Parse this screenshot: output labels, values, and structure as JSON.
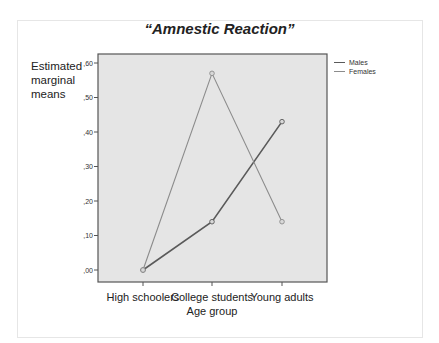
{
  "chart_data": {
    "type": "line",
    "title": "“Amnestic Reaction”",
    "xlabel": "Age group",
    "ylabel": "Estimated marginal means",
    "categories": [
      "High schoolers",
      "College students",
      "Young adults"
    ],
    "series": [
      {
        "name": "Males",
        "values": [
          0.0,
          0.14,
          0.43
        ],
        "color": "#5a5a5a"
      },
      {
        "name": "Females",
        "values": [
          0.0,
          0.57,
          0.14
        ],
        "color": "#8c8c8c"
      }
    ],
    "ylim": [
      0,
      0.6
    ],
    "yticks": [
      ",00",
      ",10",
      ",20",
      ",30",
      ",40",
      ",50",
      ",60"
    ],
    "grid": false,
    "legend_position": "right"
  },
  "legend": {
    "males": "Males",
    "females": "Females"
  },
  "colors": {
    "plot_bg": "#e5e5e5",
    "plot_border": "#555555"
  }
}
